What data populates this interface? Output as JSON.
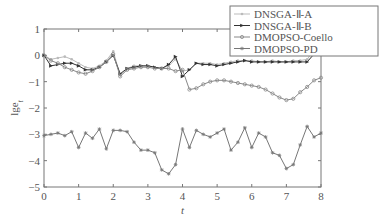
{
  "chart_data": {
    "type": "line",
    "title": "",
    "xlabel": "t",
    "ylabel": "lge_t",
    "xlim": [
      0,
      8
    ],
    "ylim": [
      -5,
      1
    ],
    "xticks": [
      0,
      1,
      2,
      3,
      4,
      5,
      6,
      7,
      8
    ],
    "yticks": [
      1,
      0,
      -1,
      -2,
      -3,
      -4,
      -5
    ],
    "grid": false,
    "legend_position": "top-right",
    "x": [
      0,
      0.2,
      0.4,
      0.6,
      0.8,
      1.0,
      1.2,
      1.4,
      1.6,
      1.8,
      2.0,
      2.2,
      2.4,
      2.6,
      2.8,
      3.0,
      3.2,
      3.4,
      3.6,
      3.8,
      4.0,
      4.2,
      4.4,
      4.6,
      4.8,
      5.0,
      5.2,
      5.4,
      5.6,
      5.8,
      6.0,
      6.2,
      6.4,
      6.6,
      6.8,
      7.0,
      7.2,
      7.4,
      7.6,
      7.8,
      8.0
    ],
    "series": [
      {
        "name": "DNSGA-Ⅱ-A",
        "marker": "dot",
        "color": "#bbbbbb",
        "values": [
          0.0,
          -0.15,
          -0.1,
          -0.05,
          -0.15,
          -0.3,
          -0.45,
          -0.5,
          -0.4,
          -0.2,
          0.15,
          -0.75,
          -0.5,
          -0.4,
          -0.4,
          -0.4,
          -0.45,
          -0.5,
          -0.4,
          -0.15,
          -0.6,
          -0.55,
          -0.3,
          -0.3,
          -0.3,
          -0.35,
          -0.3,
          -0.25,
          -0.2,
          -0.2,
          -0.2,
          -0.25,
          -0.25,
          -0.2,
          -0.25,
          -0.25,
          -0.2,
          -0.2,
          -0.15,
          0.2,
          0.1
        ]
      },
      {
        "name": "DNSGA-Ⅱ-B",
        "marker": "triangle-right",
        "color": "#333333",
        "values": [
          0.0,
          -0.4,
          -0.35,
          -0.3,
          -0.3,
          -0.4,
          -0.55,
          -0.55,
          -0.45,
          -0.25,
          0.0,
          -0.7,
          -0.5,
          -0.45,
          -0.4,
          -0.4,
          -0.45,
          -0.5,
          -0.35,
          -0.05,
          -0.8,
          -0.55,
          -0.3,
          -0.35,
          -0.35,
          -0.4,
          -0.35,
          -0.3,
          -0.25,
          -0.2,
          -0.25,
          -0.25,
          -0.25,
          -0.25,
          -0.25,
          -0.25,
          -0.25,
          -0.25,
          -0.25,
          0.05,
          0.05
        ]
      },
      {
        "name": "DMOPSO-Coello",
        "marker": "circle",
        "color": "#888888",
        "values": [
          0.0,
          -0.2,
          -0.3,
          -0.45,
          -0.55,
          -0.65,
          -0.7,
          -0.6,
          -0.45,
          -0.25,
          0.05,
          -0.8,
          -0.55,
          -0.5,
          -0.45,
          -0.45,
          -0.5,
          -0.5,
          -0.5,
          -0.6,
          -0.55,
          -1.3,
          -1.25,
          -1.1,
          -1.0,
          -0.95,
          -0.95,
          -1.0,
          -1.05,
          -1.1,
          -1.15,
          -1.2,
          -1.3,
          -1.45,
          -1.6,
          -1.7,
          -1.65,
          -1.4,
          -1.2,
          -0.95,
          -0.85
        ]
      },
      {
        "name": "DMOPSO-PD",
        "marker": "star",
        "color": "#777777",
        "values": [
          -3.05,
          -3.0,
          -2.95,
          -3.05,
          -2.9,
          -3.5,
          -2.95,
          -3.15,
          -2.8,
          -3.55,
          -2.85,
          -2.85,
          -2.9,
          -3.3,
          -3.6,
          -3.6,
          -3.7,
          -4.35,
          -4.5,
          -4.15,
          -2.8,
          -3.5,
          -2.85,
          -3.0,
          -3.1,
          -2.95,
          -2.8,
          -3.6,
          -3.3,
          -2.75,
          -3.5,
          -2.95,
          -3.1,
          -3.7,
          -3.8,
          -4.3,
          -4.15,
          -3.4,
          -2.7,
          -3.1,
          -2.95
        ]
      }
    ]
  }
}
